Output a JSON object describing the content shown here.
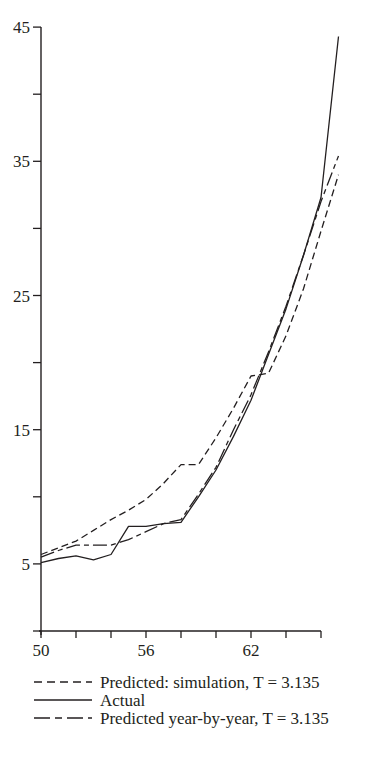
{
  "chart_data": {
    "type": "line",
    "title": "",
    "xlabel": "",
    "ylabel": "",
    "xlim": [
      50,
      67.2
    ],
    "ylim": [
      0,
      45
    ],
    "x_ticks": [
      50,
      52,
      54,
      56,
      58,
      60,
      62,
      64,
      66
    ],
    "x_tick_labels": [
      "50",
      "",
      "",
      "56",
      "",
      "",
      "62",
      "",
      ""
    ],
    "y_ticks": [
      0,
      5,
      10,
      15,
      20,
      25,
      30,
      35,
      40,
      45
    ],
    "y_tick_labels": [
      "",
      "5",
      "",
      "15",
      "",
      "25",
      "",
      "35",
      "",
      "45"
    ],
    "grid": false,
    "legend_position": "bottom",
    "x": [
      50,
      51,
      52,
      53,
      54,
      55,
      56,
      57,
      58,
      59,
      60,
      61,
      62,
      63,
      64,
      65,
      66,
      67
    ],
    "series": [
      {
        "name": "Predicted: simulation, T = 3.135",
        "style": "dashed",
        "values": [
          5.7,
          6.2,
          6.7,
          7.5,
          8.3,
          9.0,
          9.8,
          11.0,
          12.4,
          12.4,
          14.4,
          16.6,
          19.0,
          19.2,
          22.0,
          25.5,
          29.8,
          34.0
        ]
      },
      {
        "name": "Actual",
        "style": "solid",
        "values": [
          5.1,
          5.4,
          5.6,
          5.3,
          5.7,
          7.8,
          7.8,
          8.0,
          8.1,
          10.0,
          12.0,
          14.5,
          17.2,
          20.6,
          24.0,
          28.0,
          32.3,
          44.3
        ]
      },
      {
        "name": "Predicted year-by-year, T = 3.135",
        "style": "dash-dot",
        "values": [
          5.5,
          6.0,
          6.4,
          6.4,
          6.4,
          6.8,
          7.4,
          8.0,
          8.3,
          10.2,
          12.2,
          15.0,
          17.6,
          20.8,
          24.2,
          28.0,
          32.0,
          35.4
        ]
      }
    ]
  },
  "legend": {
    "items": [
      {
        "label": "Predicted: simulation, T = 3.135",
        "style": "dashed"
      },
      {
        "label": "Actual",
        "style": "solid"
      },
      {
        "label": "Predicted year-by-year, T = 3.135",
        "style": "dash-dot"
      }
    ]
  },
  "colors": {
    "ink": "#231f20",
    "background": "#ffffff"
  }
}
